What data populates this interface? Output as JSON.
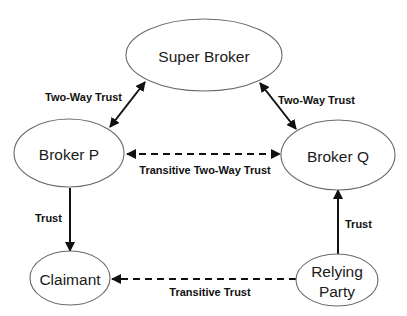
{
  "diagram": {
    "type": "trust-relationship-graph",
    "nodes": {
      "super_broker": {
        "label": "Super Broker"
      },
      "broker_p": {
        "label": "Broker P"
      },
      "broker_q": {
        "label": "Broker Q"
      },
      "claimant": {
        "label": "Claimant"
      },
      "relying_party": {
        "label_line1": "Relying",
        "label_line2": "Party"
      }
    },
    "edges": {
      "sb_bp": {
        "from": "Super Broker",
        "to": "Broker P",
        "style": "solid",
        "direction": "bidirectional",
        "label": "Two-Way Trust"
      },
      "sb_bq": {
        "from": "Super Broker",
        "to": "Broker Q",
        "style": "solid",
        "direction": "bidirectional",
        "label": "Two-Way Trust"
      },
      "bp_bq": {
        "from": "Broker P",
        "to": "Broker Q",
        "style": "dashed",
        "direction": "bidirectional",
        "label": "Transitive Two-Way Trust"
      },
      "bp_cl": {
        "from": "Broker P",
        "to": "Claimant",
        "style": "solid",
        "direction": "forward",
        "label": "Trust"
      },
      "rp_bq": {
        "from": "Relying Party",
        "to": "Broker Q",
        "style": "solid",
        "direction": "forward",
        "label": "Trust"
      },
      "rp_cl": {
        "from": "Relying Party",
        "to": "Claimant",
        "style": "dashed",
        "direction": "forward",
        "label": "Transitive Trust"
      }
    },
    "colors": {
      "node_stroke": "#6a6a6a",
      "edge": "#111111",
      "background": "#ffffff"
    }
  }
}
